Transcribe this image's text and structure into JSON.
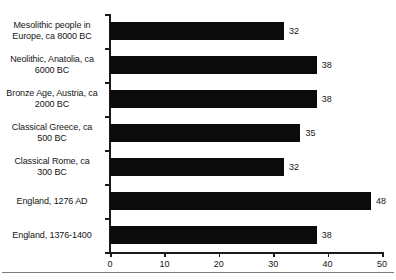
{
  "chart_data": {
    "type": "bar",
    "orientation": "horizontal",
    "title": "",
    "subtitle": "",
    "xlabel": "",
    "ylabel": "",
    "xlim": [
      0,
      50
    ],
    "xticks": [
      "0",
      "10",
      "20",
      "30",
      "40",
      "50"
    ],
    "xtick_values": [
      0,
      10,
      20,
      30,
      40,
      50
    ],
    "grid": false,
    "legend": false,
    "bar_color": "#0b0b0b",
    "categories": [
      "Mesolithic people in Europe, ca 8000 BC",
      "Neolithic, Anatolia, ca 6000 BC",
      "Bronze Age, Austria, ca 2000 BC",
      "Classical Greece, ca 500 BC",
      "Classical Rome, ca 300 BC",
      "England, 1276 AD",
      "England, 1376-1400"
    ],
    "category_lines": [
      [
        "Mesolithic people in",
        "Europe, ca 8000 BC"
      ],
      [
        "Neolithic, Anatolia, ca",
        "6000 BC"
      ],
      [
        "Bronze Age, Austria, ca",
        "2000 BC"
      ],
      [
        "Classical Greece, ca",
        "500 BC"
      ],
      [
        "Classical Rome, ca",
        "300 BC"
      ],
      [
        "England, 1276 AD"
      ],
      [
        "England, 1376-1400"
      ]
    ],
    "values": [
      32,
      38,
      38,
      35,
      32,
      48,
      38
    ],
    "value_labels": [
      "32",
      "38",
      "38",
      "35",
      "32",
      "48",
      "38"
    ]
  }
}
